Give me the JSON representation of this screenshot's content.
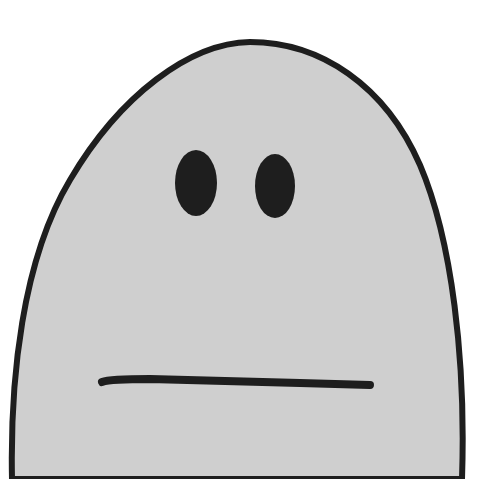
{
  "illustration": {
    "subject": "expressionless blob character",
    "colors": {
      "background": "#ffffff",
      "body_fill": "#cfcfcf",
      "outline": "#1e1e1e"
    },
    "features": [
      "body-outline",
      "left-eye",
      "right-eye",
      "flat-mouth"
    ]
  }
}
